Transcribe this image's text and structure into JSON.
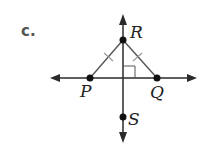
{
  "part_label": "c.",
  "points": {
    "R": {
      "label": "R",
      "x": 123,
      "y": 40
    },
    "P": {
      "label": "P",
      "x": 90,
      "y": 78
    },
    "Q": {
      "label": "Q",
      "x": 157,
      "y": 78
    },
    "S": {
      "label": "S",
      "x": 123,
      "y": 117
    }
  },
  "colors": {
    "line": "#2a2a2a",
    "tick": "#999999"
  }
}
